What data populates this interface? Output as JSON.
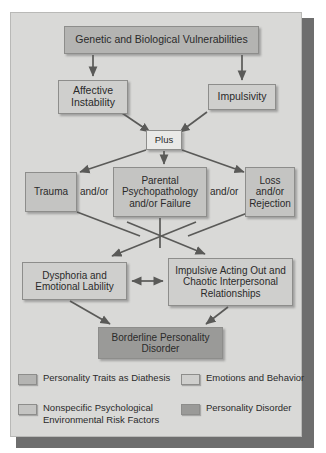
{
  "figure": {
    "type": "flowchart"
  },
  "nodes": {
    "genetic": {
      "label": "Genetic and Biological Vulnerabilities",
      "category": "Personality Traits as Diathesis"
    },
    "affective": {
      "label": "Affective Instability",
      "category": "Emotions and Behavior"
    },
    "impulsivity": {
      "label": "Impulsivity",
      "category": "Emotions and Behavior"
    },
    "plus": {
      "label": "Plus",
      "category": "connector"
    },
    "trauma": {
      "label": "Trauma",
      "category": "Nonspecific Psychological Environmental Risk Factors"
    },
    "parental": {
      "label": "Parental Psychopathology and/or Failure",
      "category": "Nonspecific Psychological Environmental Risk Factors"
    },
    "loss": {
      "label": "Loss and/or Rejection",
      "category": "Nonspecific Psychological Environmental Risk Factors"
    },
    "dysphoria": {
      "label": "Dysphoria and Emotional Lability",
      "category": "Emotions and Behavior"
    },
    "impulsive_acting": {
      "label": "Impulsive Acting Out and Chaotic Interpersonal Relationships",
      "category": "Emotions and Behavior"
    },
    "borderline": {
      "label": "Borderline Personality Disorder",
      "category": "Personality Disorder"
    }
  },
  "connectors": {
    "andor_left": "and/or",
    "andor_right": "and/or"
  },
  "legend": {
    "items": [
      {
        "label": "Personality Traits as Diathesis",
        "color": "#b4b4b2"
      },
      {
        "label": "Nonspecific Psychological Environmental Risk Factors",
        "color": "#c4c4c2"
      },
      {
        "label": "Emotions and Behavior",
        "color": "#cfcfcd"
      },
      {
        "label": "Personality Disorder",
        "color": "#9a9a98"
      }
    ]
  },
  "colors": {
    "panel_background": "#d9d9d7",
    "page_background": "#ffffff",
    "shadow": "#6e6e6e",
    "arrow": "#5a5a58",
    "text": "#2a2a2a"
  }
}
